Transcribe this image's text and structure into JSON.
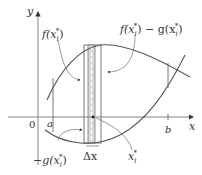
{
  "diagram": {
    "axes": {
      "x_label": "x",
      "y_label": "y",
      "origin_label": "0"
    },
    "bounds": {
      "a": "a",
      "b": "b"
    },
    "labels": {
      "f_xi": "f(x",
      "f_xi_sub": "i",
      "f_xi_sup": "*",
      "f_minus_g_f": "f(x",
      "f_minus_g_mid": ") − g(x",
      "neg_g_xi": "−g(x",
      "delta_x": "Δx",
      "xi_star": "x",
      "close_paren": ")"
    },
    "colors": {
      "curve": "#555555",
      "axis": "#777777",
      "rect_fill": "#d9d9d9",
      "rect_stroke": "#555555",
      "text": "#333333"
    }
  }
}
